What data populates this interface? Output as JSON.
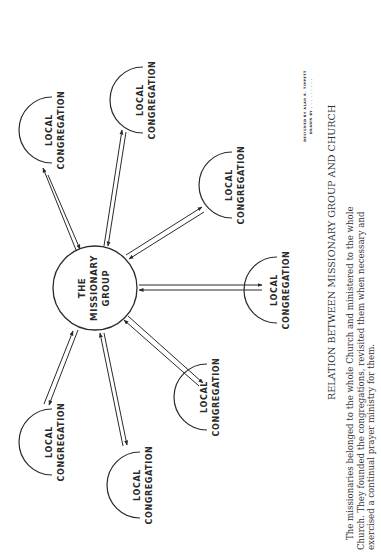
{
  "diagram": {
    "orientation": "rotated 90deg counter-clockwise (text reads bottom-to-top)",
    "center_node": {
      "line1": "THE",
      "line2": "MISSIONARY",
      "line3": "GROUP"
    },
    "congregation_label": {
      "line1": "LOCAL",
      "line2": "CONGREGATION"
    },
    "nodes": [
      {
        "id": "congregation-1",
        "line1": "LOCAL",
        "line2": "CONGREGATION"
      },
      {
        "id": "congregation-2",
        "line1": "LOCAL",
        "line2": "CONGREGATION"
      },
      {
        "id": "congregation-3",
        "line1": "LOCAL",
        "line2": "CONGREGATION"
      },
      {
        "id": "congregation-4",
        "line1": "LOCAL",
        "line2": "CONGREGATION"
      },
      {
        "id": "congregation-5",
        "line1": "LOCAL",
        "line2": "CONGREGATION"
      },
      {
        "id": "congregation-6",
        "line1": "LOCAL",
        "line2": "CONGREGATION"
      },
      {
        "id": "congregation-7",
        "line1": "LOCAL",
        "line2": "CONGREGATION"
      }
    ],
    "edges": "double-headed (parallel arrows) between The Missionary Group and each Local Congregation",
    "credit": {
      "line1": "DESIGNED BY  ALAN R. TIPPETT",
      "line2": "DRAWN BY  . . . . . . . . ."
    },
    "title": "RELATION BETWEEN MISSIONARY GROUP AND CHURCH",
    "caption": {
      "line1": "The missionaries belonged to the whole Church and ministered to the whole",
      "line2": "Church. They founded the congregations, revisited them when necessary and",
      "line3": "exercised a continual prayer ministry for them."
    }
  }
}
